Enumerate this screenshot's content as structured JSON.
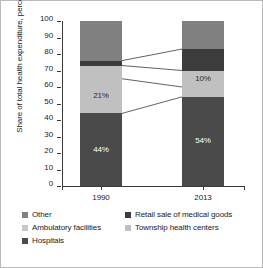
{
  "chart_data": {
    "type": "bar",
    "subtype": "stacked-bar-100",
    "title": "",
    "xlabel": "",
    "ylabel": "Share of total health expenditure, percent",
    "ylim": [
      0,
      100
    ],
    "ytick_values": [
      0,
      10,
      20,
      30,
      40,
      50,
      60,
      70,
      80,
      90,
      100
    ],
    "ytick_labels": [
      "0",
      "10",
      "20",
      "30",
      "40",
      "50",
      "60",
      "70",
      "80",
      "90",
      "100"
    ],
    "grid": false,
    "legend_position": "below",
    "categories": [
      "1990",
      "2013"
    ],
    "series": [
      {
        "name": "Hospitals",
        "color": "#4a4a4a",
        "values": [
          44,
          54
        ],
        "labels": [
          "44%",
          "54%"
        ],
        "show_label": [
          true,
          true
        ]
      },
      {
        "name": "Ambulatory facilities",
        "color": "#c0c0c0",
        "values": [
          21,
          6
        ],
        "labels": [
          "21%",
          ""
        ],
        "show_label": [
          true,
          false
        ]
      },
      {
        "name": "Township health centers",
        "color": "#c0c0c0",
        "values": [
          8,
          10
        ],
        "labels": [
          "",
          "10%"
        ],
        "show_label": [
          false,
          true
        ]
      },
      {
        "name": "Retail sale of medical goods",
        "color": "#3c3c3c",
        "values": [
          3,
          13
        ],
        "labels": [
          "",
          ""
        ],
        "show_label": [
          false,
          false
        ]
      },
      {
        "name": "Other",
        "color": "#808080",
        "values": [
          24,
          17
        ],
        "labels": [
          "",
          ""
        ],
        "show_label": [
          false,
          false
        ]
      }
    ],
    "connector_lines": [
      {
        "from": 44,
        "to": 54
      },
      {
        "from": 65,
        "to": 60
      },
      {
        "from": 73,
        "to": 70
      },
      {
        "from": 76,
        "to": 83
      }
    ],
    "annotations": [
      "44%",
      "21%",
      "54%",
      "10%"
    ]
  },
  "axis": {
    "ylabel": "Share of total health expenditure, percent",
    "ytick_labels": [
      "100",
      "90",
      "80",
      "70",
      "60",
      "50",
      "40",
      "30",
      "20",
      "10",
      "0"
    ],
    "xtick_labels": [
      "1990",
      "2013"
    ]
  },
  "legend": {
    "rows": [
      {
        "col1": {
          "label": "Other",
          "color": "#808080"
        },
        "col2": {
          "label": "Retail sale of medical goods",
          "color": "#3c3c3c"
        }
      },
      {
        "col1": {
          "label": "Ambulatory facilities",
          "color": "#c7c7c7"
        },
        "col2": {
          "label": "Township health centers",
          "color": "#c0c0c0"
        }
      },
      {
        "col1": {
          "label": "Hospitals",
          "color": "#4a4a4a"
        },
        "col2": {
          "label": "",
          "color": ""
        }
      }
    ]
  },
  "colors": {
    "hospitals": "#4a4a4a",
    "ambulatory": "#c0c0c0",
    "township": "#c0c0c0",
    "retail": "#3c3c3c",
    "other": "#808080",
    "axis": "#3a3a3a",
    "frame": "#b9b9b9",
    "text": "#1a1a1a"
  }
}
